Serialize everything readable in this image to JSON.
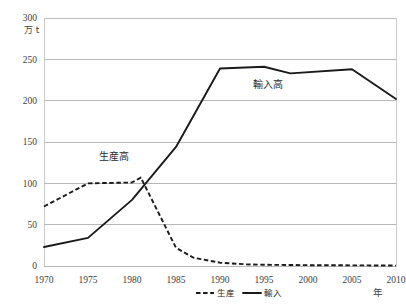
{
  "chart_data": {
    "type": "line",
    "title": "",
    "xlabel": "年",
    "ylabel": "万 t",
    "unit_label": "万 t",
    "xaxis_unit_label": "年",
    "xlim": [
      1970,
      2010
    ],
    "ylim": [
      0,
      300
    ],
    "yticks": [
      0,
      50,
      100,
      150,
      200,
      250,
      300
    ],
    "ytick_labels": [
      "0",
      "50",
      "100",
      "150",
      "200",
      "250",
      "300"
    ],
    "xticks": [
      1970,
      1975,
      1980,
      1985,
      1990,
      1995,
      2000,
      2005,
      2010
    ],
    "xtick_labels": [
      "1970",
      "1975",
      "1980",
      "1985",
      "1990",
      "1995",
      "2000",
      "2005",
      "2010"
    ],
    "grid": true,
    "legend_position": "bottom-center",
    "series": [
      {
        "name": "生産",
        "label": "生産高",
        "style": "dashed",
        "color": "#1a1a1a",
        "x": [
          1970,
          1975,
          1980,
          1981,
          1985,
          1987,
          1990,
          1993,
          1995,
          2000,
          2005,
          2010
        ],
        "values": [
          72,
          100,
          101,
          107,
          22,
          10,
          4,
          2,
          1.5,
          1,
          0.8,
          0.5
        ]
      },
      {
        "name": "輸入",
        "label": "輸入高",
        "style": "solid",
        "color": "#1a1a1a",
        "x": [
          1970,
          1975,
          1980,
          1985,
          1990,
          1995,
          1998,
          2005,
          2010
        ],
        "values": [
          23,
          34,
          80,
          144,
          239,
          241,
          233,
          238,
          202
        ]
      }
    ],
    "annotations": [
      {
        "text": "生産高",
        "x": 1978,
        "y": 128
      },
      {
        "text": "輸入高",
        "x": 1995.5,
        "y": 215
      }
    ],
    "legend": [
      {
        "label": "生産",
        "style": "dashed"
      },
      {
        "label": "輸入",
        "style": "solid"
      }
    ]
  }
}
